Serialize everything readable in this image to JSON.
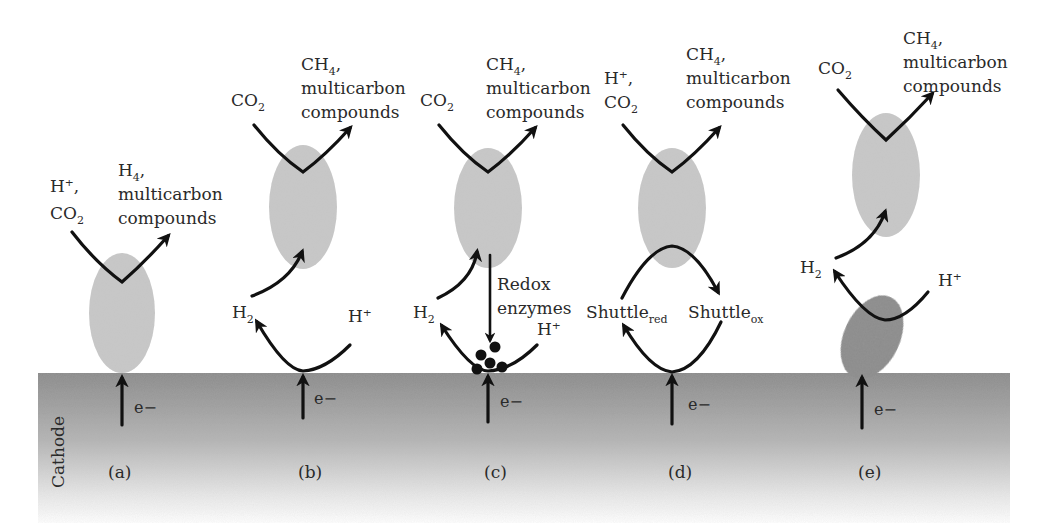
{
  "figure": {
    "substrate_label": "Cathode",
    "electron_label": "e−",
    "colors": {
      "cathode_top": "#8c8c8c",
      "cathode_bottom": "#ffffff",
      "cell_light": "#c8c8c8",
      "cell_dark": "#8a8a8a",
      "arrow": "#111111",
      "text": "#2a2a2a"
    },
    "panels": [
      {
        "id": "a",
        "caption": "(a)",
        "input": {
          "line1": "H⁺,",
          "line2_main": "CO",
          "line2_sub": "2"
        },
        "output": {
          "line1_main": "H",
          "line1_sub": "4",
          "line1_suffix": ",",
          "line2": "multicarbon",
          "line3": "compounds"
        }
      },
      {
        "id": "b",
        "caption": "(b)",
        "input": {
          "main": "CO",
          "sub": "2"
        },
        "output": {
          "line1_main": "CH",
          "line1_sub": "4",
          "line1_suffix": ",",
          "line2": "multicarbon",
          "line3": "compounds"
        },
        "mediator_left": {
          "main": "H",
          "sub": "2"
        },
        "mediator_right": {
          "main": "H⁺"
        }
      },
      {
        "id": "c",
        "caption": "(c)",
        "input": {
          "main": "CO",
          "sub": "2"
        },
        "output": {
          "line1_main": "CH",
          "line1_sub": "4",
          "line1_suffix": ",",
          "line2": "multicarbon",
          "line3": "compounds"
        },
        "mediator_left": {
          "main": "H",
          "sub": "2"
        },
        "mediator_right": {
          "main": "H⁺"
        },
        "enzyme_label": {
          "line1": "Redox",
          "line2": "enzymes"
        }
      },
      {
        "id": "d",
        "caption": "(d)",
        "input": {
          "line1": "H⁺,",
          "line2_main": "CO",
          "line2_sub": "2"
        },
        "output": {
          "line1_main": "CH",
          "line1_sub": "4",
          "line1_suffix": ",",
          "line2": "multicarbon",
          "line3": "compounds"
        },
        "mediator_left": {
          "main": "Shuttle",
          "sub": "red"
        },
        "mediator_right": {
          "main": "Shuttle",
          "sub": "ox"
        }
      },
      {
        "id": "e",
        "caption": "(e)",
        "input": {
          "main": "CO",
          "sub": "2"
        },
        "output": {
          "line1_main": "CH",
          "line1_sub": "4",
          "line1_suffix": ",",
          "line2": "multicarbon",
          "line3": "compounds"
        },
        "mediator_left": {
          "main": "H",
          "sub": "2"
        },
        "mediator_right": {
          "main": "H⁺"
        }
      }
    ]
  }
}
